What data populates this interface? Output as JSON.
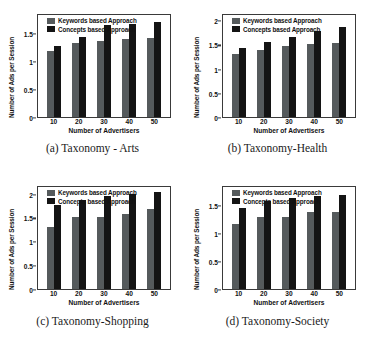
{
  "figure": {
    "legend": {
      "keywords_label": "Keywords based Approach",
      "concepts_label": "Concepts based Approach",
      "keywords_color": "#555a5c",
      "concepts_color": "#141414"
    },
    "axis": {
      "xlabel": "Number of Advertisers",
      "ylabel": "Number of Ads per Session"
    }
  },
  "chart_data": [
    {
      "type": "bar",
      "panel": "a",
      "caption": "(a)  Taxonomy - Arts",
      "title": "Taxonomy - Arts",
      "categories": [
        "10",
        "20",
        "30",
        "40",
        "50"
      ],
      "series": [
        {
          "name": "Keywords based Approach",
          "values": [
            1.18,
            1.32,
            1.35,
            1.38,
            1.41
          ]
        },
        {
          "name": "Concepts based Approach",
          "values": [
            1.26,
            1.42,
            1.63,
            1.65,
            1.69
          ]
        }
      ],
      "xlabel": "Number of Advertisers",
      "ylabel": "Number of Ads per Session",
      "ylim": [
        0,
        1.85
      ],
      "yticks": [
        "0",
        "0.5",
        "1",
        "1.5"
      ],
      "ytick_values": [
        0,
        0.5,
        1,
        1.5
      ],
      "grid": false,
      "legend_position": "top-left"
    },
    {
      "type": "bar",
      "panel": "b",
      "caption": "(b)  Taxonomy-Health",
      "title": "Taxonomy-Health",
      "categories": [
        "10",
        "20",
        "30",
        "40",
        "50"
      ],
      "series": [
        {
          "name": "Keywords based Approach",
          "values": [
            1.31,
            1.39,
            1.46,
            1.51,
            1.53
          ]
        },
        {
          "name": "Concepts based Approach",
          "values": [
            1.42,
            1.55,
            1.65,
            1.78,
            1.87
          ]
        }
      ],
      "xlabel": "Number of Advertisers",
      "ylabel": "Number of Ads per Session",
      "ylim": [
        0,
        2.15
      ],
      "yticks": [
        "0",
        "0.5",
        "1",
        "1.5",
        "2"
      ],
      "ytick_values": [
        0,
        0.5,
        1,
        1.5,
        2
      ],
      "grid": false,
      "legend_position": "top-left"
    },
    {
      "type": "bar",
      "panel": "c",
      "caption": "(c)  Taxonomy-Shopping",
      "title": "Taxonomy-Shopping",
      "categories": [
        "10",
        "20",
        "30",
        "40",
        "50"
      ],
      "series": [
        {
          "name": "Keywords based Approach",
          "values": [
            1.3,
            1.5,
            1.52,
            1.57,
            1.67
          ]
        },
        {
          "name": "Concepts based Approach",
          "values": [
            1.77,
            1.87,
            1.94,
            1.99,
            2.03
          ]
        }
      ],
      "xlabel": "Number of Advertisers",
      "ylabel": "Number of Ads per Session",
      "ylim": [
        0,
        2.18
      ],
      "yticks": [
        "0",
        "0.5",
        "1",
        "1.5",
        "2"
      ],
      "ytick_values": [
        0,
        0.5,
        1,
        1.5,
        2
      ],
      "grid": false,
      "legend_position": "top-left"
    },
    {
      "type": "bar",
      "panel": "d",
      "caption": "(d)  Taxonomy-Society",
      "title": "Taxonomy-Society",
      "categories": [
        "10",
        "20",
        "30",
        "40",
        "50"
      ],
      "series": [
        {
          "name": "Keywords based Approach",
          "values": [
            1.15,
            1.28,
            1.28,
            1.37,
            1.37
          ]
        },
        {
          "name": "Concepts based Approach",
          "values": [
            1.44,
            1.57,
            1.62,
            1.65,
            1.68
          ]
        }
      ],
      "xlabel": "Number of Advertisers",
      "ylabel": "Number of Ads per Session",
      "ylim": [
        0,
        1.85
      ],
      "yticks": [
        "0",
        "0.5",
        "1",
        "1.5"
      ],
      "ytick_values": [
        0,
        0.5,
        1,
        1.5
      ],
      "grid": false,
      "legend_position": "top-left"
    }
  ]
}
